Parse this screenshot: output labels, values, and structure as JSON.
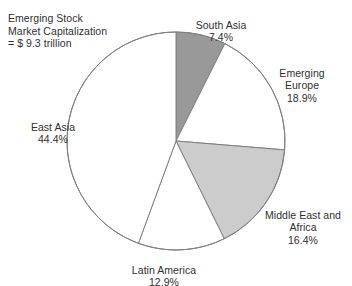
{
  "chart_data": {
    "type": "pie",
    "title": "Emerging Stock Market Capitalization = $ 9.3 trillion",
    "title_lines": "Emerging Stock\nMarket Capitalization\n= $ 9.3 trillion",
    "total_label": "= $ 9.3 trillion",
    "units": "trillion USD",
    "total_value": 9.3,
    "start_angle_deg": 0,
    "direction": "clockwise",
    "legend": "none",
    "grid": false,
    "categories": [
      "South Asia",
      "Emerging Europe",
      "Middle East and Africa",
      "Latin America",
      "East Asia"
    ],
    "values": [
      7.4,
      18.9,
      16.4,
      12.9,
      44.4
    ],
    "slices": [
      {
        "name": "South Asia",
        "label": "South Asia",
        "percent": 7.4,
        "percent_text": "7.4%",
        "color": "#999999",
        "start_deg": 0,
        "end_deg": 26.64
      },
      {
        "name": "Emerging Europe",
        "label": "Emerging\nEurope",
        "percent": 18.9,
        "percent_text": "18.9%",
        "color": "#ffffff",
        "start_deg": 26.64,
        "end_deg": 94.68
      },
      {
        "name": "Middle East and Africa",
        "label": "Middle East and\nAfrica",
        "percent": 16.4,
        "percent_text": "16.4%",
        "color": "#cccccc",
        "start_deg": 94.68,
        "end_deg": 153.72
      },
      {
        "name": "Latin America",
        "label": "Latin America",
        "percent": 12.9,
        "percent_text": "12.9%",
        "color": "#ffffff",
        "start_deg": 153.72,
        "end_deg": 200.16
      },
      {
        "name": "East Asia",
        "label": "East Asia",
        "percent": 44.4,
        "percent_text": "44.4%",
        "color": "#ffffff",
        "start_deg": 200.16,
        "end_deg": 360
      }
    ],
    "stroke_color": "#808080",
    "background": "#ffffff"
  },
  "labels": {
    "title": "Emerging Stock\nMarket Capitalization\n= $ 9.3 trillion",
    "south_asia_name": "South Asia",
    "south_asia_pct": "7.4%",
    "emerging_europe_name": "Emerging\nEurope",
    "emerging_europe_pct": "18.9%",
    "middle_east_name": "Middle East and\nAfrica",
    "middle_east_pct": "16.4%",
    "latin_america_name": "Latin America",
    "latin_america_pct": "12.9%",
    "east_asia_name": "East Asia",
    "east_asia_pct": "44.4%"
  }
}
